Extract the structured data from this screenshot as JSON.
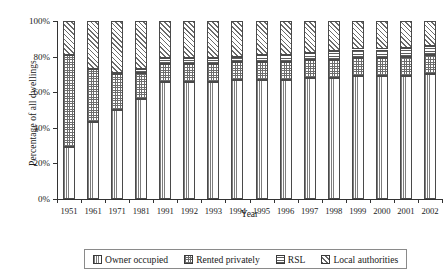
{
  "chart_data": {
    "type": "bar",
    "subtype": "100% stacked column",
    "title": "",
    "xlabel": "Year",
    "ylabel": "Percentage of all dwellings",
    "ylim": [
      0,
      100
    ],
    "ytick_labels": [
      "0%",
      "20%",
      "40%",
      "60%",
      "80%",
      "100%"
    ],
    "ytick_values": [
      0,
      20,
      40,
      60,
      80,
      100
    ],
    "grid": false,
    "legend_position": "bottom",
    "categories": [
      "1951",
      "1961",
      "1971",
      "1981",
      "1991",
      "1992",
      "1993",
      "1994",
      "1995",
      "1996",
      "1997",
      "1998",
      "1999",
      "2000",
      "2001",
      "2002"
    ],
    "series": [
      {
        "name": "Owner occupied",
        "pattern": "dotted",
        "values": [
          29,
          43,
          50,
          56,
          66,
          66,
          66,
          67,
          67,
          67,
          68,
          68,
          69,
          69,
          69,
          70
        ]
      },
      {
        "name": "Rented privately",
        "pattern": "checkered",
        "values": [
          52,
          30,
          20,
          15,
          10,
          10,
          10,
          10,
          10,
          10,
          10,
          10,
          10,
          10,
          11,
          11
        ]
      },
      {
        "name": "RSL",
        "pattern": "horizontal-lines",
        "values": [
          0,
          0,
          1,
          2,
          3,
          3,
          3,
          3,
          4,
          4,
          4,
          5,
          5,
          5,
          5,
          5
        ]
      },
      {
        "name": "Local authorities",
        "pattern": "diagonal-hatch",
        "values": [
          19,
          27,
          29,
          27,
          21,
          21,
          21,
          20,
          19,
          19,
          18,
          17,
          16,
          16,
          15,
          14
        ]
      }
    ]
  },
  "legend": {
    "items": [
      {
        "label": "Owner occupied",
        "pattern": "dotted"
      },
      {
        "label": "Rented privately",
        "pattern": "checkered"
      },
      {
        "label": "RSL",
        "pattern": "horizontal-lines"
      },
      {
        "label": "Local authorities",
        "pattern": "diagonal-hatch"
      }
    ]
  }
}
